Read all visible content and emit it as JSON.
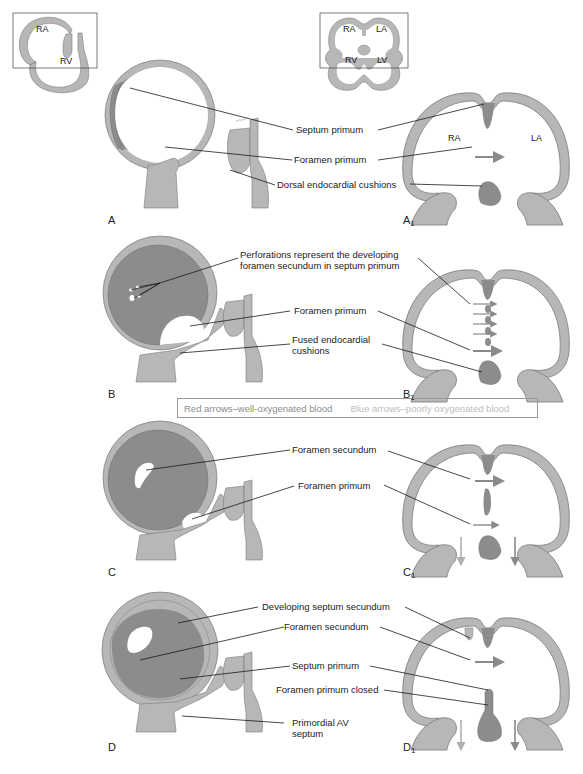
{
  "colors": {
    "wall": "#b7b7b7",
    "wall_outline": "#7a7a7a",
    "septum": "#8c8c8c",
    "red_arrow": "#8a8a8a",
    "blue_arrow": "#b0b0b0",
    "leader_line": "#1a1a1a"
  },
  "insets": {
    "left": {
      "ra": "RA",
      "rv": "RV"
    },
    "right": {
      "ra": "RA",
      "la": "LA",
      "rv": "RV",
      "lv": "LV"
    }
  },
  "panels": {
    "A": {
      "letter": "A"
    },
    "A1": {
      "letter": "A",
      "sub": "1",
      "ra": "RA",
      "la": "LA"
    },
    "B": {
      "letter": "B"
    },
    "B1": {
      "letter": "B",
      "sub": "1"
    },
    "C": {
      "letter": "C"
    },
    "C1": {
      "letter": "C",
      "sub": "1"
    },
    "D": {
      "letter": "D"
    },
    "D1": {
      "letter": "D",
      "sub": "1"
    }
  },
  "labels": {
    "a_septum_primum": "Septum primum",
    "a_foramen_primum": "Foramen primum",
    "a_dorsal_cushions": "Dorsal endocardial cushions",
    "b_perforations_1": "Perforations represent the developing",
    "b_perforations_2": "foramen secundum in septum primum",
    "b_foramen_primum": "Foramen primum",
    "b_fused_1": "Fused endocardial",
    "b_fused_2": "cushions",
    "c_foramen_secundum": "Foramen secundum",
    "c_foramen_primum": "Foramen primum",
    "d_developing_septum_secundum": "Developing septum secundum",
    "d_foramen_secundum": "Foramen secundum",
    "d_septum_primum": "Septum primum",
    "d_foramen_primum_closed": "Foramen primum closed",
    "d_primordial_av_1": "Primordial AV",
    "d_primordial_av_2": "septum"
  },
  "legend": {
    "red": "Red arrows–well-oxygenated blood",
    "blue": "Blue arrows–poorly oxygenated blood"
  }
}
